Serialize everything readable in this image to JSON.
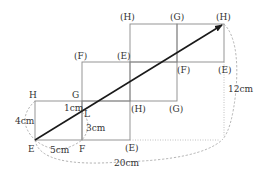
{
  "diagram": {
    "vertex_labels": {
      "H": "H",
      "G": "G",
      "E": "E",
      "F": "F",
      "L": "L",
      "H2": "(H)",
      "G2": "(G)",
      "E2": "(E)",
      "F3": "(F)",
      "E3": "(E)",
      "F4": "(F)",
      "E4": "(E)",
      "H5": "(H)",
      "G5": "(G)",
      "H6": "(H)"
    },
    "measurements": {
      "height": "4cm",
      "width": "5cm",
      "seg_top": "1cm",
      "seg_bottom": "3cm",
      "total_width": "20cm",
      "total_height": "12cm"
    },
    "colors": {
      "grid": "#8a8a8a",
      "arrow": "#1a1a1a",
      "dashed": "#a0a0a0",
      "text": "#333333"
    }
  }
}
